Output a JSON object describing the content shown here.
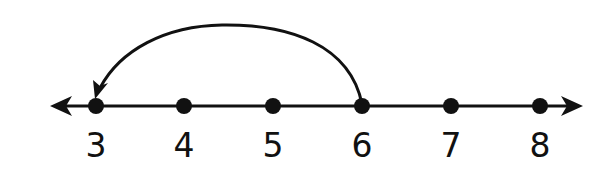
{
  "diagram": {
    "type": "number-line",
    "ticks": [
      {
        "value": "3",
        "x": 96
      },
      {
        "value": "4",
        "x": 184
      },
      {
        "value": "5",
        "x": 273
      },
      {
        "value": "6",
        "x": 362
      },
      {
        "value": "7",
        "x": 451
      },
      {
        "value": "8",
        "x": 540
      }
    ],
    "jump": {
      "from": "6",
      "to": "3",
      "direction": "left"
    },
    "colors": {
      "ink": "#111111",
      "background": "#ffffff"
    }
  }
}
